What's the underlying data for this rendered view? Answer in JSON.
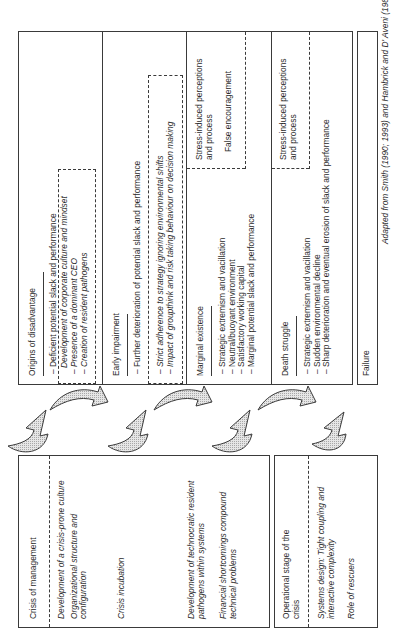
{
  "stages": [
    {
      "title": "Origins of disadvantage",
      "items": [
        "Deficient potential slack and performance"
      ],
      "dashed_items_first": "Development of corporate culture and mindset",
      "dashed_items": [
        "Presence of a dominant CEO",
        "Creation of resident pathogens"
      ]
    },
    {
      "title": "Early impairment",
      "items": [
        "Further deterioration of potential slack and performance"
      ],
      "dashed_items": [
        "Strict adherence to strategy ignoring environmental shifts",
        "Impact of groupthink and risk taking behaviour on decision making"
      ]
    },
    {
      "title": "Marginal existence",
      "items": [
        "Strategic extremism and vacillation",
        "Neutral/buoyant environment",
        "Satisfactory working capital",
        "Marginal potential slack and performance"
      ],
      "side_lines": [
        "Stress-induced perceptions",
        "and process"
      ],
      "side_extra": "False encouragement"
    },
    {
      "title": "Death struggle",
      "items": [
        "Strategic extremism and vacillation",
        "Sudden environmental decline",
        "Sharp deterioration and eventual erosion of slack and performance"
      ],
      "side_lines": [
        "Stress-induced perceptions",
        "and process"
      ]
    }
  ],
  "failure": {
    "label": "Failure"
  },
  "footnote": "Adapted from Smith (1990; 1993) and Hambrick and D' Aveni (1988)",
  "crisis_of_management": {
    "title": "Crisis of management",
    "groups": [
      [
        "Development of a crisis-prone culture",
        "Organizational structure and",
        "configuration"
      ],
      [
        "Crisis incubation"
      ],
      [
        "Development of technocratic resident",
        "pathogens within systems"
      ],
      [
        "Financial shortcomings compound",
        "technical problems"
      ]
    ]
  },
  "operational_stage": {
    "title_lines": [
      "Operational stage of the",
      "crisis"
    ],
    "groups": [
      [
        "Systems design: Tight coupling and",
        "interactive complexity"
      ],
      [
        "Role of rescuers"
      ]
    ]
  },
  "colors": {
    "line": "#3a3a3a",
    "arrow_fill": "#cfcfcf",
    "text": "#2a2a2a"
  }
}
